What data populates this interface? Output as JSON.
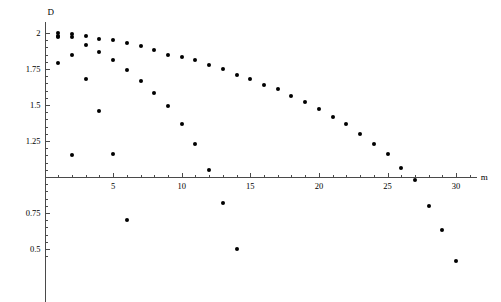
{
  "chart_data": {
    "type": "scatter",
    "title": "",
    "xlabel": "m",
    "ylabel": "D",
    "xlim": [
      0,
      31.5
    ],
    "ylim": [
      0.38,
      2.07
    ],
    "grid": false,
    "legend": "none",
    "axis_crossing_y": 1.0,
    "xticks_major": [
      5,
      10,
      15,
      20,
      25,
      30
    ],
    "xticks_minor_step": 1,
    "yticks_major": [
      2,
      1.75,
      1.5,
      1.25,
      0.75,
      0.5
    ],
    "ytick_labels": [
      "2",
      "1.75",
      "1.5",
      "1.25",
      "0.75",
      "0.5"
    ],
    "xtick_labels": [
      "5",
      "10",
      "15",
      "20",
      "25",
      "30"
    ],
    "marker": "filled-circle",
    "marker_color": "#000000",
    "axis_color": "#4a4a4a",
    "series": [
      {
        "name": "series-1",
        "x": [
          1,
          2,
          3,
          4,
          5,
          6,
          7,
          8,
          9,
          10,
          11,
          12,
          13,
          14,
          15,
          16,
          17,
          18,
          19,
          20,
          21,
          22,
          23,
          24,
          25,
          26,
          27,
          28,
          29,
          30
        ],
        "y": [
          2.0,
          1.99,
          1.98,
          1.96,
          1.95,
          1.93,
          1.91,
          1.88,
          1.85,
          1.83,
          1.81,
          1.78,
          1.75,
          1.71,
          1.68,
          1.64,
          1.61,
          1.56,
          1.52,
          1.47,
          1.42,
          1.37,
          1.3,
          1.23,
          1.16,
          1.06,
          0.98,
          0.8,
          0.63,
          0.42
        ]
      },
      {
        "name": "series-2",
        "x": [
          1,
          2,
          3,
          4,
          5,
          6,
          7,
          8,
          9,
          10,
          11,
          12,
          13,
          14
        ],
        "y": [
          1.98,
          1.97,
          1.92,
          1.87,
          1.81,
          1.74,
          1.67,
          1.58,
          1.49,
          1.37,
          1.23,
          1.05,
          0.82,
          0.5
        ]
      },
      {
        "name": "series-3",
        "x": [
          1,
          2,
          3,
          4,
          5,
          6
        ],
        "y": [
          1.97,
          1.85,
          1.68,
          1.46,
          1.16,
          0.7
        ]
      },
      {
        "name": "series-4",
        "x": [
          1,
          2
        ],
        "y": [
          1.79,
          1.15
        ]
      }
    ]
  },
  "axis_titles": {
    "y": "D",
    "x": "m"
  }
}
